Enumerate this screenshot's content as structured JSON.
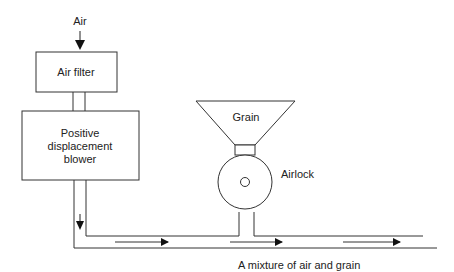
{
  "diagram": {
    "type": "pneumatic conveying process diagram",
    "labels": {
      "air_inlet": "Air",
      "air_filter": "Air filter",
      "blower_line1": "Positive",
      "blower_line2": "displacement",
      "blower_line3": "blower",
      "hopper": "Grain",
      "airlock": "Airlock",
      "output": "A mixture of air and grain"
    },
    "components": [
      {
        "id": "air-filter",
        "label": "Air filter"
      },
      {
        "id": "blower",
        "label": "Positive displacement blower"
      },
      {
        "id": "grain-hopper",
        "label": "Grain"
      },
      {
        "id": "airlock",
        "label": "Airlock"
      },
      {
        "id": "conveying-pipe",
        "label": "A mixture of air and grain"
      }
    ],
    "flow": [
      "Air",
      "Air filter",
      "Positive displacement blower",
      "conveying pipe",
      "Airlock (grain feed)",
      "A mixture of air and grain"
    ],
    "colors": {
      "line": "#333333",
      "text": "#222222",
      "background": "#ffffff"
    }
  }
}
